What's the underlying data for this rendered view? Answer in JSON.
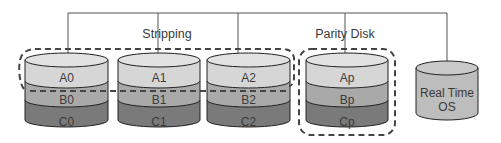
{
  "diagram": {
    "type": "RAID 4 / striping with dedicated parity disk",
    "groups": [
      {
        "id": "stripping",
        "label": "Stripping"
      },
      {
        "id": "parity",
        "label": "Parity Disk"
      }
    ],
    "disks": [
      {
        "id": "disk0",
        "group": "stripping",
        "blocks": [
          "A0",
          "B0",
          "C0"
        ]
      },
      {
        "id": "disk1",
        "group": "stripping",
        "blocks": [
          "A1",
          "B1",
          "C1"
        ]
      },
      {
        "id": "disk2",
        "group": "stripping",
        "blocks": [
          "A2",
          "B2",
          "C2"
        ]
      },
      {
        "id": "parity",
        "group": "parity",
        "blocks": [
          "Ap",
          "Bp",
          "Cp"
        ]
      }
    ],
    "os_disk": {
      "line1": "Real Time",
      "line2": "OS"
    },
    "colors": {
      "line": "#555555",
      "dash": "#444444",
      "row_a": "#d6d6d6",
      "row_b": "#a9a9a9",
      "row_c": "#7a7a7a",
      "top": "#e2e2e2",
      "os_body": "#bdbdbd",
      "os_top": "#c9c9c9"
    }
  }
}
